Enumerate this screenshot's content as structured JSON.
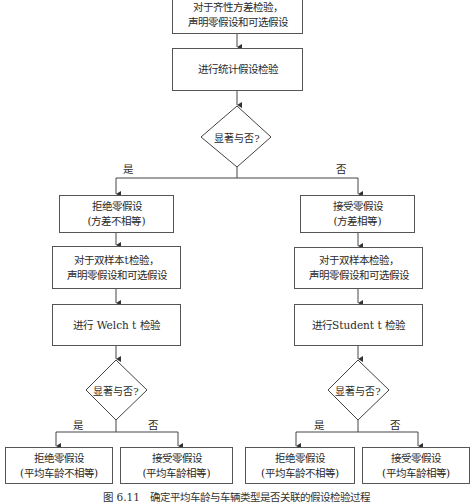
{
  "flowchart": {
    "top_box": {
      "line1": "对于齐性方差检验，",
      "line2": "声明零假设和可选假设"
    },
    "stat_test_box": {
      "label": "进行统计假设检验"
    },
    "decision_main": {
      "label": "显著与否?"
    },
    "branch_yes": "是",
    "branch_no": "否",
    "left": {
      "reject_box": {
        "line1": "拒绝零假设",
        "line2": "(方差不相等)"
      },
      "declare_box": {
        "line1": "对于双样本t检验，",
        "line2": "声明零假设和可选假设"
      },
      "test_box": {
        "label": "进行 Welch t 检验"
      },
      "decision": {
        "label": "显著与否?"
      },
      "yes_label": "是",
      "no_label": "否",
      "outcome_reject": {
        "line1": "拒绝零假设",
        "line2": "(平均车龄不相等)"
      },
      "outcome_accept": {
        "line1": "接受零假设",
        "line2": "(平均车龄相等)"
      }
    },
    "right": {
      "accept_box": {
        "line1": "接受零假设",
        "line2": "(方差相等)"
      },
      "declare_box": {
        "line1": "对于双样本检验，",
        "line2": "声明零假设和可选假设"
      },
      "test_box": {
        "label": "进行Student t 检验"
      },
      "decision": {
        "label": "显著与否?"
      },
      "yes_label": "是",
      "no_label": "否",
      "outcome_reject": {
        "line1": "拒绝零假设",
        "line2": "(平均车龄不相等)"
      },
      "outcome_accept": {
        "line1": "接受零假设",
        "line2": "(平均车龄相等)"
      }
    },
    "caption": "图 6.11　确定平均车龄与车辆类型是否关联的假设检验过程"
  }
}
